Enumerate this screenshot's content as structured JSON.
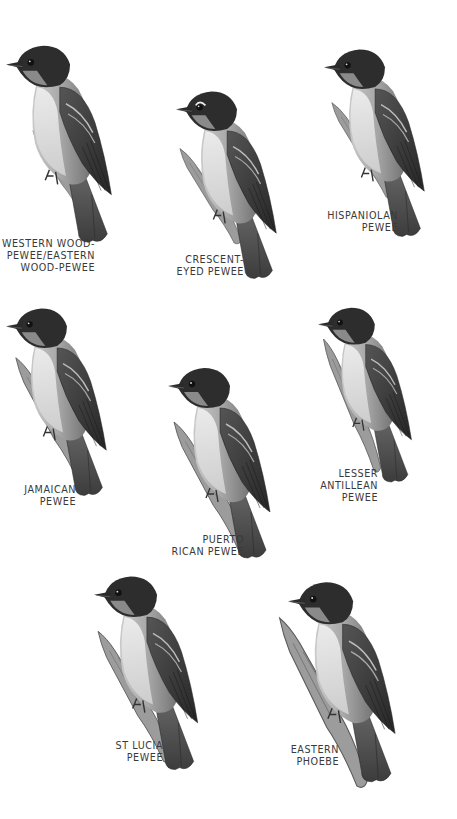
{
  "plate": {
    "description": "Field guide plate of pewee and phoebe species",
    "colors": {
      "background": "#ffffff",
      "label_text": "#3a3a3a",
      "cap": "#2a2a2a",
      "wing": "#3c3c3c",
      "body": "#9a9a9a",
      "belly": "#dcdcdc",
      "branch": "#8a8a8a"
    }
  },
  "species": [
    {
      "id": "western-wood-pewee",
      "label_lines": [
        "WESTERN WOOD-",
        "PEWEE/EASTERN",
        "WOOD-PEWEE"
      ]
    },
    {
      "id": "crescent-eyed-pewee",
      "label_lines": [
        "CRESCENT-",
        "EYED PEWEE"
      ]
    },
    {
      "id": "hispaniolan-pewee",
      "label_lines": [
        "HISPANIOLAN",
        "PEWEE"
      ]
    },
    {
      "id": "jamaican-pewee",
      "label_lines": [
        "JAMAICAN",
        "PEWEE"
      ]
    },
    {
      "id": "puerto-rican-pewee",
      "label_lines": [
        "PUERTO",
        "RICAN PEWEE"
      ]
    },
    {
      "id": "lesser-antillean-pewee",
      "label_lines": [
        "LESSER",
        "ANTILLEAN",
        "PEWEE"
      ]
    },
    {
      "id": "st-lucia-pewee",
      "label_lines": [
        "ST LUCIA",
        "PEWEE"
      ]
    },
    {
      "id": "eastern-phoebe",
      "label_lines": [
        "EASTERN",
        "PHOEBE"
      ]
    }
  ]
}
